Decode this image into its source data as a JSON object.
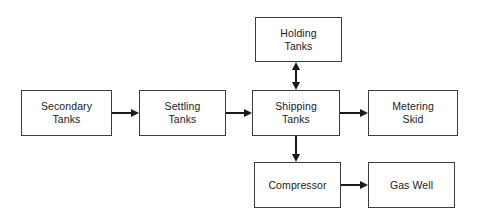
{
  "diagram": {
    "background_color": "#ffffff",
    "box_border_color": "#3c3c3c",
    "connector_color": "#1a1a1a",
    "text_color": "#1a1a1a",
    "nodes": [
      {
        "id": "secondary-tanks",
        "label": "Secondary\nTanks",
        "line1": "Secondary",
        "line2": "Tanks",
        "x": 21,
        "y": 90,
        "w": 91,
        "h": 46
      },
      {
        "id": "settling-tanks",
        "label": "Settling\nTanks",
        "line1": "Settling",
        "line2": "Tanks",
        "x": 139,
        "y": 90,
        "w": 87,
        "h": 46
      },
      {
        "id": "shipping-tanks",
        "label": "Shipping\nTanks",
        "line1": "Shipping",
        "line2": "Tanks",
        "x": 252,
        "y": 90,
        "w": 88,
        "h": 46
      },
      {
        "id": "metering-skid",
        "label": "Metering\nSkid",
        "line1": "Metering",
        "line2": "Skid",
        "x": 368,
        "y": 90,
        "w": 90,
        "h": 46
      },
      {
        "id": "holding-tanks",
        "label": "Holding\nTanks",
        "line1": "Holding",
        "line2": "Tanks",
        "x": 255,
        "y": 17,
        "w": 87,
        "h": 45
      },
      {
        "id": "compressor",
        "label": "Compressor",
        "line1": "Compressor",
        "line2": "",
        "x": 254,
        "y": 162,
        "w": 87,
        "h": 46
      },
      {
        "id": "gas-well",
        "label": "Gas Well",
        "line1": "Gas Well",
        "line2": "",
        "x": 368,
        "y": 162,
        "w": 87,
        "h": 46
      }
    ],
    "connectors": [
      {
        "id": "secondary-to-settling",
        "from": "secondary-tanks",
        "to": "settling-tanks",
        "direction": "right",
        "bidirectional": false
      },
      {
        "id": "settling-to-shipping",
        "from": "settling-tanks",
        "to": "shipping-tanks",
        "direction": "right",
        "bidirectional": false
      },
      {
        "id": "shipping-to-metering",
        "from": "shipping-tanks",
        "to": "metering-skid",
        "direction": "right",
        "bidirectional": false
      },
      {
        "id": "shipping-to-holding",
        "from": "shipping-tanks",
        "to": "holding-tanks",
        "direction": "vertical",
        "bidirectional": true
      },
      {
        "id": "shipping-to-compressor",
        "from": "shipping-tanks",
        "to": "compressor",
        "direction": "down",
        "bidirectional": false
      },
      {
        "id": "compressor-to-gaswell",
        "from": "compressor",
        "to": "gas-well",
        "direction": "right",
        "bidirectional": false
      }
    ]
  }
}
